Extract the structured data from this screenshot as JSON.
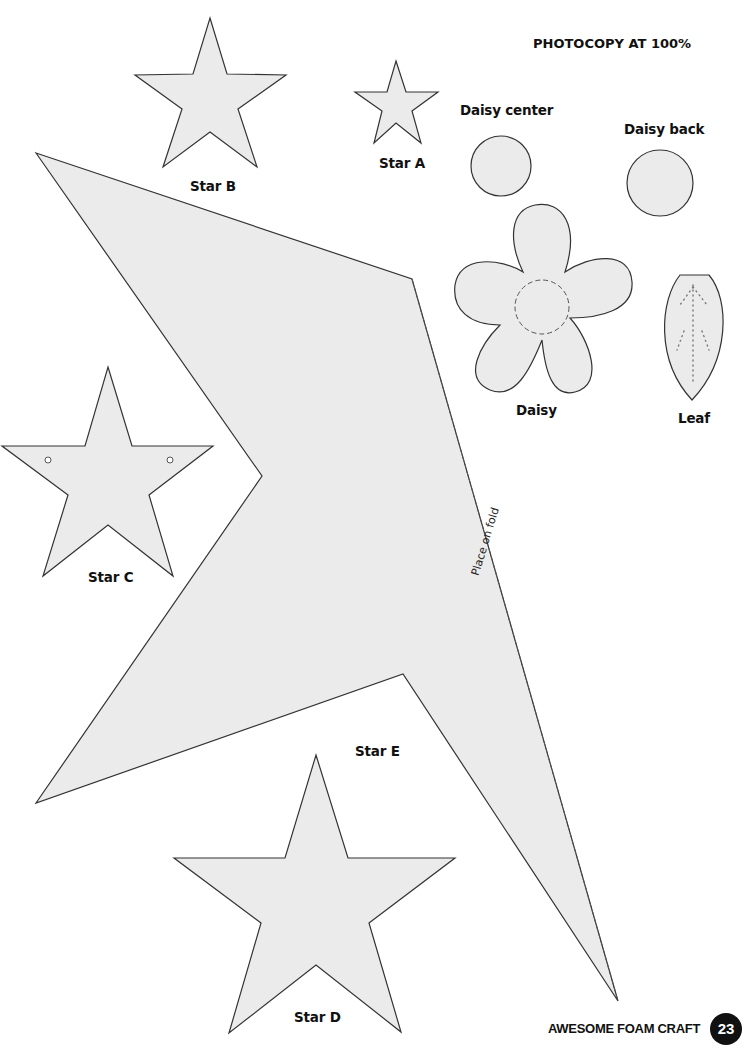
{
  "page": {
    "instruction": "PHOTOCOPY AT 100%",
    "footer_title": "AWESOME FOAM CRAFT",
    "page_number": "23"
  },
  "templates": {
    "star_a": {
      "label": "Star A"
    },
    "star_b": {
      "label": "Star B"
    },
    "star_c": {
      "label": "Star C"
    },
    "star_d": {
      "label": "Star D"
    },
    "star_e": {
      "label": "Star E",
      "fold_note": "Place on fold"
    },
    "daisy_center": {
      "label": "Daisy center"
    },
    "daisy_back": {
      "label": "Daisy back"
    },
    "daisy": {
      "label": "Daisy"
    },
    "leaf": {
      "label": "Leaf"
    }
  },
  "colors": {
    "shape_fill": "#ebebeb",
    "outline": "#333333",
    "text": "#111111",
    "badge_bg": "#111111",
    "badge_text": "#ffffff"
  }
}
